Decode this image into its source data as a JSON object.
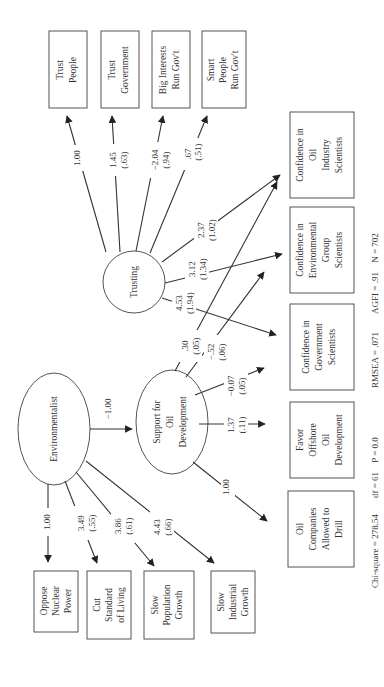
{
  "diagram": {
    "orientation": "rotated 90deg counter-clockwise",
    "latent": {
      "environmentalist": "Environmentalist",
      "support": [
        "Support for",
        "Oil",
        "Development"
      ],
      "trusting": "Trusting"
    },
    "indicators_environmentalist": [
      {
        "label": [
          "Oppose",
          "Nuclear",
          "Power"
        ],
        "coef": "1.00",
        "se": ""
      },
      {
        "label": [
          "Cut",
          "Standard",
          "of Living"
        ],
        "coef": "3.49",
        "se": "(.55)"
      },
      {
        "label": [
          "Slow",
          "Population",
          "Growth"
        ],
        "coef": "3.86",
        "se": "(.61)"
      },
      {
        "label": [
          "Slow",
          "Industrial",
          "Growth"
        ],
        "coef": "4.43",
        "se": "(.66)"
      }
    ],
    "indicators_trusting": [
      {
        "label": [
          "Trust",
          "People"
        ],
        "coef": "1.00",
        "se": ""
      },
      {
        "label": [
          "Trust",
          "Government"
        ],
        "coef": "1.45",
        "se": "(.63)"
      },
      {
        "label": [
          "Big Interests",
          "Run Gov't"
        ],
        "coef": "−2.04",
        "se": "(.94)"
      },
      {
        "label": [
          "Smart",
          "People",
          "Run Gov't"
        ],
        "coef": ".67",
        "se": "(.51)"
      }
    ],
    "indicators_support": [
      {
        "label": [
          "Oil",
          "Companies",
          "Allowed to",
          "Drill"
        ],
        "coef": "1.00",
        "se": ""
      },
      {
        "label": [
          "Favor",
          "Offshore",
          "Oil",
          "Development"
        ],
        "coef": "1.37",
        "se": "(.11)"
      },
      {
        "label": [
          "Confidence in",
          "Government",
          "Scientists"
        ],
        "coef": "−0.07",
        "se": "(.05)"
      },
      {
        "label": [
          "Confidence in",
          "Environmental",
          "Group",
          "Scientists"
        ],
        "coef": "−.52",
        "se": "(.06)"
      },
      {
        "label": [
          "Confidence in",
          "Oil",
          "Industry",
          "Scientists"
        ],
        "coef": ".30",
        "se": "(.05)"
      }
    ],
    "trusting_to_confidence": [
      {
        "target": "Confidence in Government Scientists",
        "coef": "4.53",
        "se": "(1.94)"
      },
      {
        "target": "Confidence in Environmental Group Scientists",
        "coef": "3.12",
        "se": "(1.34)"
      },
      {
        "target": "Confidence in Oil Industry Scientists",
        "coef": "2.37",
        "se": "(1.02)"
      }
    ],
    "env_to_support": {
      "coef": "−1.00"
    },
    "fit": {
      "chi_square": "Chi-square = 278.54",
      "df": "df = 61",
      "p": "P = 0.0",
      "rmsea": "RMSEA = .071",
      "agfi": "AGFI = .91",
      "n": "N = 702"
    },
    "colors": {
      "line": "#333333",
      "box_border": "#555555",
      "background": "#ffffff"
    }
  }
}
